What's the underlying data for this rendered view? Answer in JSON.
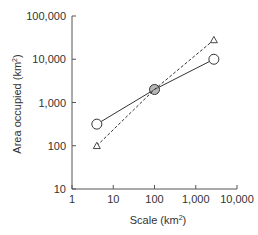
{
  "chart_data": {
    "type": "line",
    "title": "",
    "xlabel": "Scale (km²)",
    "xlabel_base": "Scale (km",
    "xlabel_sup": "2",
    "xlabel_tail": ")",
    "ylabel": "Area occupied (km²)",
    "ylabel_base": "Area occupied (km",
    "ylabel_sup": "2",
    "ylabel_tail": ")",
    "xscale": "log",
    "yscale": "log",
    "xlim": [
      1,
      10000
    ],
    "ylim": [
      10,
      100000
    ],
    "xticks": [
      1,
      10,
      100,
      1000,
      10000
    ],
    "xtick_labels": [
      "1",
      "10",
      "100",
      "1,000",
      "10,000"
    ],
    "yticks": [
      10,
      100,
      1000,
      10000,
      100000
    ],
    "ytick_labels": [
      "10",
      "100",
      "1,000",
      "10,000",
      "100,000"
    ],
    "grid": false,
    "legend": null,
    "series": [
      {
        "name": "circles (solid line)",
        "marker": "circle",
        "line": "solid",
        "x": [
          4,
          100,
          2750
        ],
        "y": [
          316,
          2000,
          10000
        ]
      },
      {
        "name": "triangles (dashed line)",
        "marker": "triangle",
        "line": "dashed",
        "x": [
          4,
          100,
          2750
        ],
        "y": [
          100,
          2000,
          28000
        ]
      }
    ]
  },
  "style": {
    "axis_color": "#555555",
    "line_color": "#333333",
    "marker_fill": "#ffffff",
    "center_marker_fill": "#888888"
  }
}
